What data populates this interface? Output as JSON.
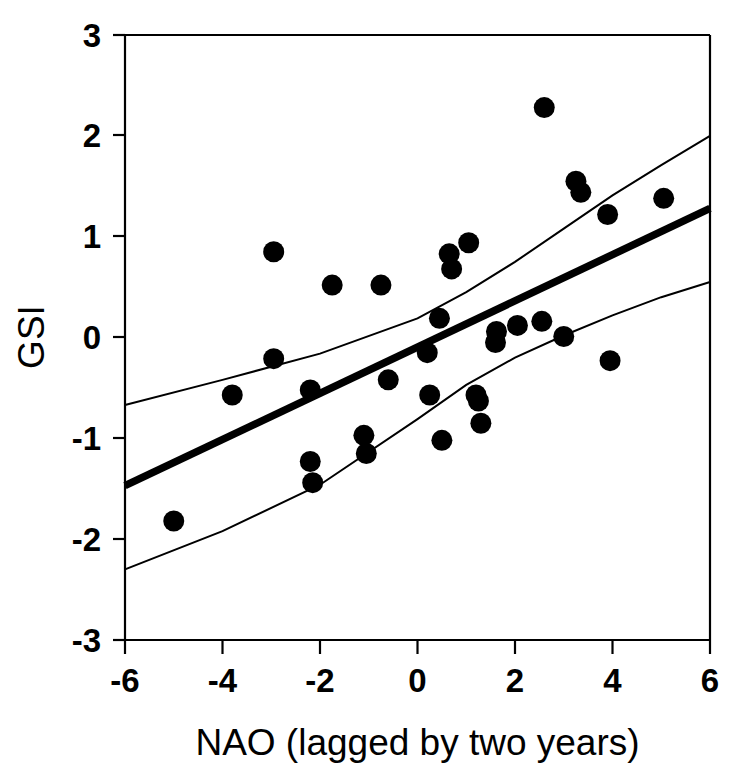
{
  "chart_data": {
    "type": "scatter",
    "title": "",
    "xlabel": "NAO (lagged by two years)",
    "ylabel": "GSI",
    "xlim": [
      -6,
      6
    ],
    "ylim": [
      -3,
      3
    ],
    "xticks": [
      -6,
      -4,
      -2,
      0,
      2,
      4,
      6
    ],
    "xtick_labels": [
      "-6",
      "-4",
      "-2",
      "0",
      "2",
      "4",
      "6"
    ],
    "yticks": [
      -3,
      -2,
      -1,
      0,
      1,
      2,
      3
    ],
    "ytick_labels": [
      "-3",
      "-2",
      "-1",
      "0",
      "1",
      "2",
      "3"
    ],
    "grid": false,
    "legend": "none",
    "marker": "filled-circle",
    "marker_color": "#000000",
    "points": [
      {
        "x": -5.0,
        "y": -1.82
      },
      {
        "x": -3.8,
        "y": -0.57
      },
      {
        "x": -2.95,
        "y": 0.85
      },
      {
        "x": -2.95,
        "y": -0.21
      },
      {
        "x": -2.2,
        "y": -0.52
      },
      {
        "x": -2.2,
        "y": -1.23
      },
      {
        "x": -2.15,
        "y": -1.44
      },
      {
        "x": -1.75,
        "y": 0.52
      },
      {
        "x": -1.1,
        "y": -0.97
      },
      {
        "x": -1.05,
        "y": -1.15
      },
      {
        "x": -0.75,
        "y": 0.52
      },
      {
        "x": -0.6,
        "y": -0.42
      },
      {
        "x": 0.2,
        "y": -0.15
      },
      {
        "x": 0.25,
        "y": -0.57
      },
      {
        "x": 0.45,
        "y": 0.19
      },
      {
        "x": 0.5,
        "y": -1.02
      },
      {
        "x": 0.65,
        "y": 0.83
      },
      {
        "x": 0.7,
        "y": 0.68
      },
      {
        "x": 1.05,
        "y": 0.94
      },
      {
        "x": 1.2,
        "y": -0.57
      },
      {
        "x": 1.25,
        "y": -0.63
      },
      {
        "x": 1.3,
        "y": -0.85
      },
      {
        "x": 1.6,
        "y": -0.05
      },
      {
        "x": 1.62,
        "y": 0.06
      },
      {
        "x": 2.05,
        "y": 0.12
      },
      {
        "x": 2.55,
        "y": 0.16
      },
      {
        "x": 2.6,
        "y": 2.28
      },
      {
        "x": 3.0,
        "y": 0.01
      },
      {
        "x": 3.25,
        "y": 1.55
      },
      {
        "x": 3.35,
        "y": 1.44
      },
      {
        "x": 3.9,
        "y": 1.22
      },
      {
        "x": 3.95,
        "y": -0.23
      },
      {
        "x": 5.05,
        "y": 1.38
      }
    ],
    "regression_line": {
      "name": "fitted regression",
      "x": [
        -6,
        6
      ],
      "y": [
        -1.47,
        1.28
      ],
      "style": "thick-solid"
    },
    "confidence_bands": [
      {
        "name": "upper confidence limit",
        "x": [
          -6,
          -4,
          -2,
          0,
          1,
          2,
          3,
          4,
          5,
          6
        ],
        "y": [
          -0.67,
          -0.42,
          -0.16,
          0.19,
          0.45,
          0.75,
          1.08,
          1.41,
          1.71,
          2.0
        ],
        "style": "thin-solid"
      },
      {
        "name": "lower confidence limit",
        "x": [
          -6,
          -4,
          -2,
          0,
          1,
          2,
          3,
          4,
          5,
          6
        ],
        "y": [
          -2.3,
          -1.92,
          -1.46,
          -0.81,
          -0.47,
          -0.2,
          0.02,
          0.22,
          0.4,
          0.55
        ],
        "style": "thin-solid"
      }
    ]
  },
  "axes": {
    "x_title": "NAO (lagged by two years)",
    "y_title": "GSI",
    "x_tick_labels": [
      "-6",
      "-4",
      "-2",
      "0",
      "2",
      "4",
      "6"
    ],
    "y_tick_labels": [
      "3",
      "2",
      "1",
      "0",
      "-1",
      "-2",
      "-3"
    ]
  },
  "colors": {
    "ink": "#000000",
    "background": "#ffffff"
  }
}
